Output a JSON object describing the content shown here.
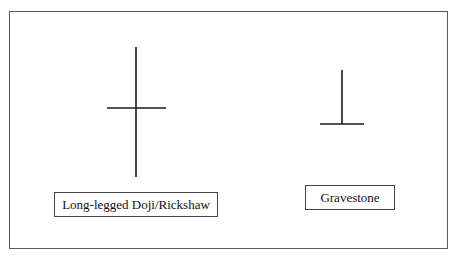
{
  "diagram": {
    "patterns": [
      {
        "id": "long-legged-doji",
        "label": "Long-legged Doji/Rickshaw",
        "shape": "cross with long upper and lower shadows"
      },
      {
        "id": "gravestone",
        "label": "Gravestone",
        "shape": "inverted T — long upper shadow, no lower shadow"
      }
    ],
    "colors": {
      "line": "#1a1a1a",
      "frame": "#5a5a5a",
      "background": "#ffffff"
    }
  }
}
